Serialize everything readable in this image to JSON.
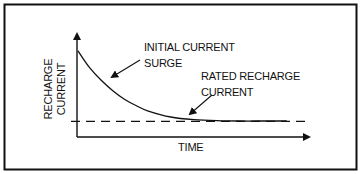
{
  "chart_data": {
    "type": "line",
    "title": "",
    "xlabel": "TIME",
    "ylabel": "RECHARGE CURRENT",
    "grid": false,
    "x_ticks": [],
    "y_ticks": [],
    "xlim": [
      0,
      1
    ],
    "ylim": [
      0,
      1
    ],
    "series": [
      {
        "name": "recharge-current",
        "style": "solid",
        "x": [
          0,
          0.05,
          0.1,
          0.15,
          0.2,
          0.25,
          0.3,
          0.4,
          0.5,
          0.6,
          0.7,
          0.8,
          0.9
        ],
        "y": [
          0.82,
          0.66,
          0.54,
          0.44,
          0.36,
          0.3,
          0.25,
          0.19,
          0.165,
          0.155,
          0.152,
          0.152,
          0.152
        ]
      },
      {
        "name": "rated-recharge-current",
        "style": "dashed",
        "x": [
          -0.03,
          1.0
        ],
        "y": [
          0.15,
          0.15
        ]
      }
    ],
    "annotations": [
      {
        "id": "initial-surge",
        "lines": [
          "INITIAL CURRENT",
          "SURGE"
        ],
        "points_to": {
          "x": 0.13,
          "y": 0.52
        }
      },
      {
        "id": "rated-recharge",
        "lines": [
          "RATED RECHARGE",
          "CURRENT"
        ],
        "points_to": {
          "x": 0.46,
          "y": 0.17
        }
      }
    ]
  }
}
